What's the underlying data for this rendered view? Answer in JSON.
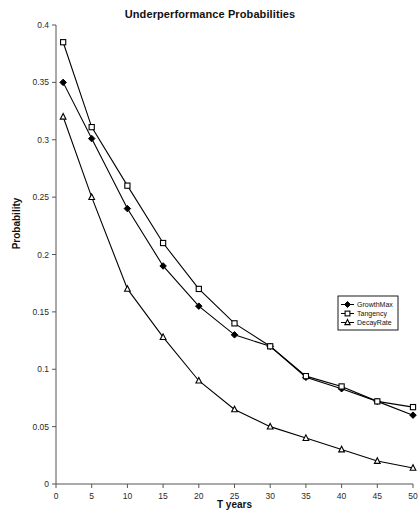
{
  "chart_data": {
    "type": "line",
    "title": "Underperformance Probabilities",
    "xlabel": "T years",
    "ylabel": "Probability",
    "x": [
      1,
      5,
      10,
      15,
      20,
      25,
      30,
      35,
      40,
      45,
      50
    ],
    "xlim": [
      0,
      50
    ],
    "ylim": [
      0,
      0.4
    ],
    "xticks": [
      "0",
      "5",
      "10",
      "15",
      "20",
      "25",
      "30",
      "35",
      "40",
      "45",
      "50"
    ],
    "xtick_values": [
      0,
      5,
      10,
      15,
      20,
      25,
      30,
      35,
      40,
      45,
      50
    ],
    "yticks": [
      "0",
      "0.05",
      "0.1",
      "0.15",
      "0.2",
      "0.25",
      "0.3",
      "0.35",
      "0.4"
    ],
    "ytick_values": [
      0,
      0.05,
      0.1,
      0.15,
      0.2,
      0.25,
      0.3,
      0.35,
      0.4
    ],
    "grid": false,
    "legend_position": "center-right",
    "series": [
      {
        "name": "GrowthMax",
        "marker": "diamond",
        "color": "#000000",
        "values": [
          0.35,
          0.301,
          0.24,
          0.19,
          0.155,
          0.13,
          0.12,
          0.093,
          0.083,
          0.072,
          0.06
        ]
      },
      {
        "name": "Tangency",
        "marker": "square",
        "color": "#000000",
        "values": [
          0.385,
          0.311,
          0.26,
          0.21,
          0.17,
          0.14,
          0.12,
          0.094,
          0.085,
          0.072,
          0.067
        ]
      },
      {
        "name": "DecayRate",
        "marker": "triangle",
        "color": "#000000",
        "values": [
          0.32,
          0.25,
          0.17,
          0.128,
          0.09,
          0.065,
          0.05,
          0.04,
          0.03,
          0.02,
          0.014
        ]
      }
    ]
  },
  "legend": {
    "items": [
      {
        "label": "GrowthMax"
      },
      {
        "label": "Tangency"
      },
      {
        "label": "DecayRate"
      }
    ]
  }
}
